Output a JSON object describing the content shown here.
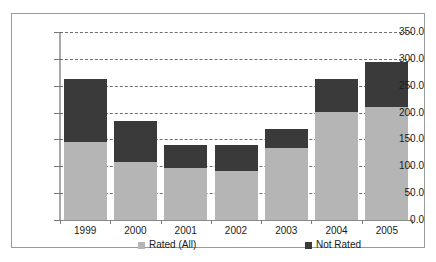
{
  "chart_data": {
    "type": "bar",
    "subtype": "stacked-bar",
    "title": "",
    "xlabel": "",
    "ylabel": "",
    "categories": [
      "1999",
      "2000",
      "2001",
      "2002",
      "2003",
      "2004",
      "2005"
    ],
    "series": [
      {
        "name": "Rated (All)",
        "color": "#b5b5b5",
        "values": [
          145.0,
          108.0,
          96.0,
          92.0,
          134.0,
          202.0,
          210.0
        ]
      },
      {
        "name": "Not Rated",
        "color": "#3a3a3a",
        "values": [
          118.0,
          77.0,
          43.0,
          47.0,
          36.0,
          60.0,
          85.0
        ]
      }
    ],
    "totals": [
      263.0,
      185.0,
      139.0,
      139.0,
      170.0,
      262.0,
      295.0
    ],
    "ylim": [
      0.0,
      350.0
    ],
    "ytick_step": 50.0,
    "ytick_labels": [
      "350.0",
      "300.0",
      "250.0",
      "200.0",
      "150.0",
      "100.0",
      "50.0",
      "0.0"
    ],
    "ytick_values": [
      350.0,
      300.0,
      250.0,
      200.0,
      150.0,
      100.0,
      50.0,
      0.0
    ],
    "grid": true,
    "grid_style": "dashed-horizontal",
    "legend_position": "bottom",
    "legend": [
      {
        "label": "Rated (All)",
        "color": "#b5b5b5",
        "swatch": "square-light-gray"
      },
      {
        "label": "Not Rated",
        "color": "#3a3a3a",
        "swatch": "square-dark-gray"
      }
    ]
  },
  "frame": {
    "border_color": "#9a9a9a",
    "background": "#ffffff"
  }
}
